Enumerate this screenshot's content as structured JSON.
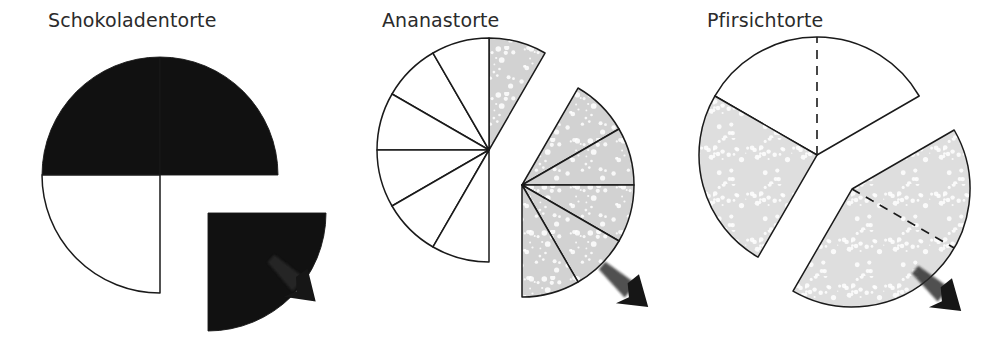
{
  "figure": {
    "background": "#ffffff",
    "ink": "#1a1a1a",
    "panel_count": 3
  },
  "panels": [
    {
      "title": "Schokoladentorte",
      "title_x": 48,
      "center_x": 160,
      "center_y": 175,
      "radius": 118,
      "fill_dark": "#111111",
      "fill_light": "#ffffff",
      "stroke": "#1a1a1a",
      "explode_dx": 48,
      "explode_dy": 38,
      "arrow_x": 300,
      "arrow_y": 286,
      "arrow_rotation": 42,
      "slices": [
        {
          "name": "slice-top-left",
          "start": 270,
          "end": 360,
          "fill": "dark",
          "exploded": false,
          "dashed_split": null
        },
        {
          "name": "slice-top-right",
          "start": 0,
          "end": 90,
          "fill": "dark",
          "exploded": false,
          "dashed_split": null
        },
        {
          "name": "slice-bottom-left",
          "start": 180,
          "end": 270,
          "fill": "light",
          "exploded": false,
          "dashed_split": null
        },
        {
          "name": "slice-bottom-right",
          "start": 90,
          "end": 180,
          "fill": "dark",
          "exploded": true,
          "dashed_split": null
        }
      ]
    },
    {
      "title": "Ananastorte",
      "title_x": 48,
      "center_x": 155,
      "center_y": 150,
      "radius": 112,
      "fill_dark": "#d2d2d2",
      "fill_light": "#ffffff",
      "stroke": "#1a1a1a",
      "explode_dx": 33,
      "explode_dy": 35,
      "arrow_x": 298,
      "arrow_y": 292,
      "arrow_rotation": 40,
      "slices": [
        {
          "name": "slice-1",
          "start": 0,
          "end": 30,
          "fill": "dark",
          "exploded": false,
          "dashed_split": null
        },
        {
          "name": "slice-2",
          "start": 300,
          "end": 330,
          "fill": "light",
          "exploded": false,
          "dashed_split": null
        },
        {
          "name": "slice-3",
          "start": 330,
          "end": 360,
          "fill": "light",
          "exploded": false,
          "dashed_split": null
        },
        {
          "name": "slice-4",
          "start": 270,
          "end": 300,
          "fill": "light",
          "exploded": false,
          "dashed_split": null
        },
        {
          "name": "slice-5",
          "start": 240,
          "end": 270,
          "fill": "light",
          "exploded": false,
          "dashed_split": null
        },
        {
          "name": "slice-6",
          "start": 210,
          "end": 240,
          "fill": "light",
          "exploded": false,
          "dashed_split": null
        },
        {
          "name": "slice-7",
          "start": 180,
          "end": 210,
          "fill": "light",
          "exploded": false,
          "dashed_split": null
        },
        {
          "name": "slice-8",
          "start": 30,
          "end": 60,
          "fill": "dark",
          "exploded": true,
          "dashed_split": null
        },
        {
          "name": "slice-9",
          "start": 60,
          "end": 90,
          "fill": "dark",
          "exploded": true,
          "dashed_split": null
        },
        {
          "name": "slice-10",
          "start": 90,
          "end": 120,
          "fill": "dark",
          "exploded": true,
          "dashed_split": null
        },
        {
          "name": "slice-11",
          "start": 120,
          "end": 150,
          "fill": "dark",
          "exploded": true,
          "dashed_split": null
        },
        {
          "name": "slice-12",
          "start": 150,
          "end": 180,
          "fill": "dark",
          "exploded": true,
          "dashed_split": null
        }
      ]
    },
    {
      "title": "Pfirsichtorte",
      "title_x": 40,
      "center_x": 150,
      "center_y": 155,
      "radius": 118,
      "fill_dark": "#dedede",
      "fill_light": "#ffffff",
      "stroke": "#1a1a1a",
      "explode_dx": 35,
      "explode_dy": 34,
      "arrow_x": 278,
      "arrow_y": 296,
      "arrow_rotation": 40,
      "slices": [
        {
          "name": "slice-white-top",
          "start": 300,
          "end": 60,
          "fill": "light",
          "exploded": false,
          "dashed_split": 0
        },
        {
          "name": "slice-shaded-left",
          "start": 210,
          "end": 300,
          "fill": "dark",
          "exploded": false,
          "dashed_split": null
        },
        {
          "name": "slice-shaded-explode",
          "start": 60,
          "end": 210,
          "fill": "dark",
          "exploded": true,
          "dashed_split": 120
        }
      ]
    }
  ],
  "chart_data": {
    "type": "pie",
    "title": "",
    "note": "Three hand-drawn pie (cake) diagrams labelled in German, each with a portion exploded and marked by an arrow.",
    "charts": [
      {
        "label": "Schokoladentorte",
        "type": "pie",
        "total_slices": 4,
        "slice_fraction": "1/4",
        "categories": [
          "gegessen",
          "uebrig"
        ],
        "values": [
          3,
          1
        ],
        "shaded_count": 3,
        "unshaded_count": 1,
        "exploded_count": 1,
        "exploded_fraction": "1/4",
        "shaded_fraction": "3/4",
        "legend": []
      },
      {
        "label": "Ananastorte",
        "type": "pie",
        "total_slices": 12,
        "slice_fraction": "1/12",
        "categories": [
          "gegessen",
          "uebrig"
        ],
        "values": [
          6,
          6
        ],
        "shaded_count": 6,
        "unshaded_count": 6,
        "exploded_count": 5,
        "exploded_fraction": "5/12",
        "shaded_fraction": "6/12",
        "legend": []
      },
      {
        "label": "Pfirsichtorte",
        "type": "pie",
        "total_slices": 3,
        "slice_fraction": "varies",
        "categories": [
          "gegessen",
          "uebrig"
        ],
        "values": [
          2,
          1
        ],
        "shaded_count": 2,
        "unshaded_count": 1,
        "exploded_count": 1,
        "exploded_fraction": "5/12",
        "shaded_fraction": "2/3",
        "legend": []
      }
    ],
    "xlabel": "",
    "ylabel": "",
    "grid": false,
    "legend_position": "none"
  }
}
